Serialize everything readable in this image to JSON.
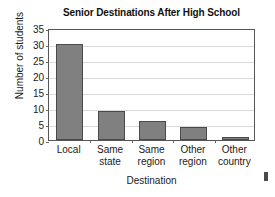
{
  "chart_data": {
    "type": "bar",
    "title": "Senior Destinations After High School",
    "xlabel": "Destination",
    "ylabel": "Number of students",
    "categories": [
      "Local",
      "Same state",
      "Same region",
      "Other region",
      "Other country"
    ],
    "category_lines": [
      [
        "Local"
      ],
      [
        "Same",
        "state"
      ],
      [
        "Same",
        "region"
      ],
      [
        "Other",
        "region"
      ],
      [
        "Other",
        "country"
      ]
    ],
    "values": [
      30,
      9,
      6,
      4,
      1
    ],
    "ylim": [
      0,
      35
    ],
    "yticks": [
      0,
      5,
      10,
      15,
      20,
      25,
      30,
      35
    ],
    "ytick_labels": [
      "0",
      "5",
      "10",
      "15",
      "20",
      "25",
      "30",
      "35"
    ],
    "grid": true,
    "legend": "none",
    "bar_color": "#808080",
    "bar_edge_color": "#4a4a4a",
    "frame_color": "#555555",
    "grid_color": "#d8d8d8"
  }
}
